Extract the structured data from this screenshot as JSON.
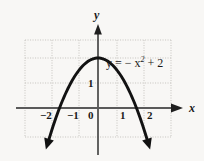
{
  "figure": {
    "background_color": "#f8f7f5",
    "curve_color": "#121212",
    "axis_color": "#4a4a4a",
    "grid_color": "#c8c6c2",
    "equation_label": "y = − x",
    "equation_exponent": "2",
    "equation_tail": "+ 2",
    "x_axis_name": "x",
    "y_axis_name": "y",
    "x_tick_labels": [
      "−2",
      "−1",
      "0",
      "1",
      "2"
    ],
    "y_tick_labels": [
      "1"
    ]
  },
  "chart_data": {
    "type": "line",
    "title": "",
    "subtitle": "",
    "xlabel": "x",
    "ylabel": "y",
    "xlim": [
      -2.7,
      3.0
    ],
    "ylim": [
      -1.2,
      2.8
    ],
    "grid": true,
    "grid_spacing": {
      "x": 1,
      "y": 1
    },
    "legend": "none",
    "annotations": [
      {
        "text": "y = − x² + 2",
        "x": 0.35,
        "y": 2.0
      }
    ],
    "series": [
      {
        "name": "y = -x^2 + 2",
        "equation": "y = -x^2 + 2",
        "vertex": [
          0,
          2
        ],
        "roots": [
          -1.414,
          1.414
        ],
        "x": [
          -1.75,
          -1.5,
          -1.25,
          -1.0,
          -0.75,
          -0.5,
          -0.25,
          0,
          0.25,
          0.5,
          0.75,
          1.0,
          1.25,
          1.5,
          1.75
        ],
        "values": [
          -1.06,
          -0.25,
          0.44,
          1.0,
          1.44,
          1.75,
          1.94,
          2.0,
          1.94,
          1.75,
          1.44,
          1.0,
          0.44,
          -0.25,
          -1.06
        ],
        "arrow_ends": [
          "left-down",
          "right-down"
        ]
      }
    ],
    "x_ticks": [
      -2,
      -1,
      0,
      1,
      2
    ],
    "y_ticks": [
      1
    ]
  }
}
